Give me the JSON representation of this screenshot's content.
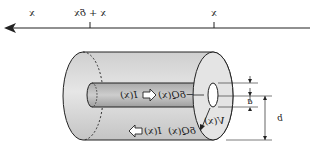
{
  "diagram": {
    "type": "coaxial-cable-segment",
    "mirrored": true,
    "axis": {
      "direction": "left",
      "labels": [
        {
          "text": "x",
          "position": "far-left"
        },
        {
          "text": "x + δx",
          "position": "tick-left"
        },
        {
          "text": "x",
          "position": "tick-right"
        }
      ]
    },
    "labels": {
      "inner_current": "I(x)",
      "inner_charge": "−δQ(x)",
      "outer_current": "I(x)",
      "outer_charge": "δQ(x)",
      "voltage": "V(x)",
      "inner_dim": "a",
      "outer_dim": "b"
    },
    "colors": {
      "outer_fill": "#d9d9d9",
      "inner_fill": "#bdbdbd",
      "stroke": "#222222",
      "background": "#ffffff"
    }
  }
}
